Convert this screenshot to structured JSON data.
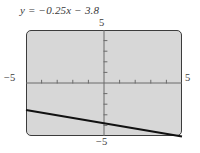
{
  "figure": {
    "equation_label": "y = −0.25x − 3.8",
    "frame_color": "#3c3c3c",
    "plot_background": "#d7d7d7",
    "line_color": "#111111",
    "axis_color": "#6b6b6b"
  },
  "labels": {
    "top": "5",
    "bottom": "−5",
    "left": "−5",
    "right": "5"
  },
  "chart_data": {
    "type": "line",
    "title": "y = −0.25x − 3.8",
    "xlabel": "",
    "ylabel": "",
    "xlim": [
      -5,
      5
    ],
    "ylim": [
      -5,
      5
    ],
    "grid": false,
    "legend": "none",
    "x_tick_labels": [
      "−5",
      "5"
    ],
    "y_tick_labels": [
      "−5",
      "5"
    ],
    "x_ticks": [
      -4,
      -3,
      -2,
      -1,
      1,
      2,
      3,
      4
    ],
    "y_ticks": [
      -4,
      -3,
      -2,
      -1,
      1,
      2,
      3,
      4
    ],
    "tick_interval": 1,
    "series": [
      {
        "name": "y = −0.25x − 3.8",
        "slope": -0.25,
        "intercept": -3.8,
        "x": [
          -5,
          5
        ],
        "values": [
          -2.55,
          -5.05
        ]
      }
    ],
    "annotations": []
  }
}
